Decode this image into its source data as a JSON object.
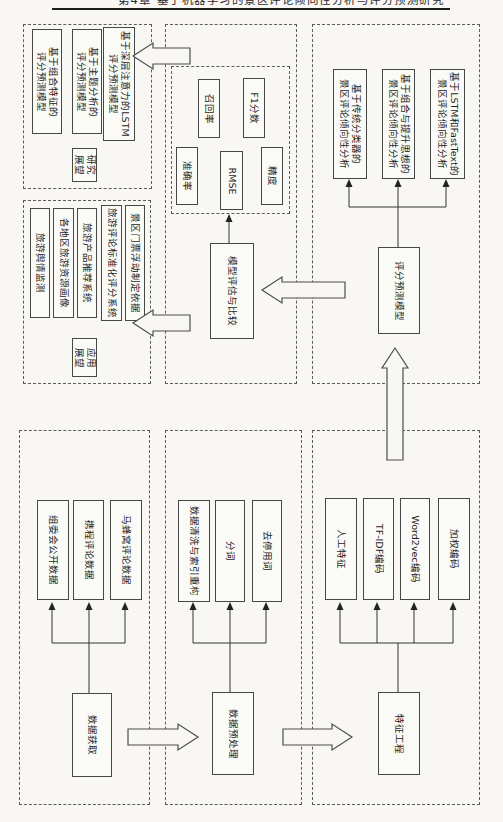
{
  "page": {
    "header_partial": "第4章 基于机器学习的景区评论倾向性分析与评分预测研究"
  },
  "modules": {
    "research_outlook": {
      "label": "研究\n展望",
      "boxes": [
        "基于组合特征的\n评分预测模型",
        "基于主题分析的\n评分预测模型",
        "基于深层注意力的LSTM\n评分预测模型"
      ]
    },
    "evaluation": {
      "metrics": [
        "召回率",
        "F1分数",
        "准确率",
        "RMSE",
        "精度"
      ],
      "compare": "模型评估与比较"
    },
    "sentiment": {
      "boxes": [
        "基于传统分类器的\n景区评论倾向性分析",
        "基于组合与提升思想的\n景区评论倾向性分析",
        "基于LSTM和FastText的\n景区评论倾向性分析"
      ],
      "model": "评分预测模型"
    },
    "application": {
      "label": "应用\n展望",
      "items": [
        "旅游舆情监测",
        "各地区旅游资源画像",
        "旅游产品推荐系统",
        "旅游评论标准化评分系统",
        "景区门票浮动制定依据"
      ]
    },
    "acquisition": {
      "label": "数据获取",
      "items": [
        "组委会公开数据",
        "携程评论数据",
        "马蜂窝评论数据"
      ]
    },
    "preprocessing": {
      "label": "数据预处理",
      "items": [
        "数据清洗与索引重构",
        "分词",
        "去停用词"
      ]
    },
    "features": {
      "label": "特征工程",
      "items": [
        "人工特征",
        "TF-IDF编码",
        "Word2vec编码",
        "加权编码"
      ]
    }
  }
}
